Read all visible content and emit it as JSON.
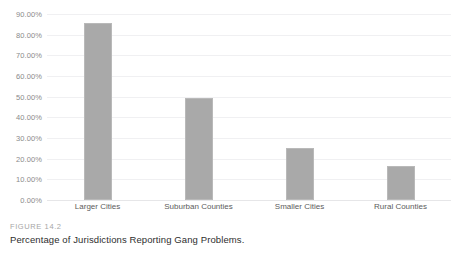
{
  "chart_data": {
    "type": "bar",
    "title": "Percentage of Jurisdictions Reporting Gang Problems.",
    "subtitle": "FIGURE 14.2",
    "xlabel": "",
    "ylabel": "",
    "categories": [
      "Larger Cities",
      "Suburban Counties",
      "Smaller Cities",
      "Rural Counties"
    ],
    "values": [
      85.5,
      49.5,
      25.0,
      16.3
    ],
    "value_labels": [
      "85.50%",
      "49.50%",
      "25.00%",
      "16.30%"
    ],
    "ylim": [
      0,
      90
    ],
    "ytick_values": [
      0,
      10,
      20,
      30,
      40,
      50,
      60,
      70,
      80,
      90
    ],
    "ytick_labels": [
      "0.00%",
      "10.00%",
      "20.00%",
      "30.00%",
      "40.00%",
      "50.00%",
      "60.00%",
      "70.00%",
      "80.00%",
      "90.00%"
    ],
    "grid": true,
    "legend": false,
    "legend_position": "none",
    "series": [
      {
        "name": "Percentage of Jurisdictions Reporting Gang Problems",
        "values": [
          85.5,
          49.5,
          25.0,
          16.3
        ]
      }
    ],
    "colors": {
      "bar_fill": "#a9a9a9",
      "bar_stroke": "#b9b9b9",
      "gridline": "#f0f0f2",
      "axis_line": "#e6e6e8",
      "tick_label": "#8a8a8a",
      "category_label": "#5c5c5c",
      "caption_label": "#a6a6a6",
      "caption_text": "#2e2e2e",
      "background": "#ffffff"
    }
  },
  "caption": {
    "figure_number": "FIGURE 14.2",
    "figure_title": "Percentage of Jurisdictions Reporting Gang Problems."
  }
}
